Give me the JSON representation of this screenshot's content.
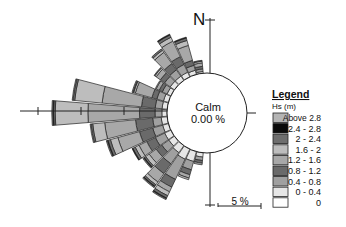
{
  "chart_data": {
    "type": "wave-rose",
    "title": "",
    "north_label": "N",
    "calm": {
      "label": "Calm",
      "value": "0.00 %"
    },
    "scale_bar": {
      "label": "5 %",
      "percent": 5
    },
    "legend": {
      "title": "Legend",
      "subtitle": "Hs (m)",
      "bins": [
        {
          "label": "Above 2.8",
          "color": "#b4b4b4"
        },
        {
          "label": "2.4 - 2.8",
          "color": "#0a0a0a"
        },
        {
          "label": "2 - 2.4",
          "color": "#6e6e6e"
        },
        {
          "label": "1.6 - 2",
          "color": "#bdbdbd"
        },
        {
          "label": "1.2 - 1.6",
          "color": "#a8a8a8"
        },
        {
          "label": "0.8 - 1.2",
          "color": "#6a6a6a"
        },
        {
          "label": "0.4 - 0.8",
          "color": "#a0a0a0"
        },
        {
          "label": "0 - 0.4",
          "color": "#e6e6e6"
        },
        {
          "label": "0",
          "color": "#ffffff"
        }
      ]
    },
    "stack_order_inner_to_outer": [
      "0",
      "0 - 0.4",
      "0.4 - 0.8",
      "0.8 - 1.2",
      "1.2 - 1.6",
      "1.6 - 2",
      "2 - 2.4",
      "2.4 - 2.8",
      "Above 2.8"
    ],
    "sectors": [
      {
        "dir": 190,
        "values": [
          0,
          0.5,
          0.4,
          0.3,
          0.2,
          0,
          0,
          0,
          0
        ]
      },
      {
        "dir": 200,
        "values": [
          0,
          1.2,
          1.0,
          0.6,
          0.4,
          0.2,
          0,
          0,
          0
        ]
      },
      {
        "dir": 210,
        "values": [
          0,
          1.3,
          2.6,
          1.0,
          0.6,
          0.5,
          0.3,
          0.1,
          0.1
        ]
      },
      {
        "dir": 220,
        "values": [
          0,
          1.0,
          1.6,
          1.4,
          1.2,
          0.4,
          0.2,
          0.1,
          0.1
        ]
      },
      {
        "dir": 230,
        "values": [
          0,
          0.8,
          1.0,
          0.8,
          1.0,
          0.5,
          0.2,
          0.1,
          0.1
        ]
      },
      {
        "dir": 240,
        "values": [
          0,
          0.8,
          1.2,
          1.1,
          1.0,
          0.5,
          0.3,
          0.1,
          0.0
        ]
      },
      {
        "dir": 250,
        "values": [
          0,
          0.7,
          1.2,
          1.6,
          2.6,
          0.9,
          0.3,
          0.1,
          0.1
        ]
      },
      {
        "dir": 260,
        "values": [
          0,
          0.7,
          1.0,
          2.0,
          3.6,
          1.4,
          0.2,
          0.0,
          0.1
        ]
      },
      {
        "dir": 270,
        "values": [
          0,
          0.6,
          0.8,
          1.8,
          6.0,
          3.8,
          0.2,
          0.1,
          0.1
        ]
      },
      {
        "dir": 280,
        "values": [
          0,
          0.6,
          0.8,
          1.6,
          4.6,
          3.2,
          0.2,
          0.0,
          0.1
        ]
      },
      {
        "dir": 290,
        "values": [
          0,
          0.6,
          0.8,
          0.6,
          2.0,
          0.2,
          0.1,
          0,
          0.1
        ]
      },
      {
        "dir": 300,
        "values": [
          0,
          0.5,
          0.6,
          0.4,
          0.4,
          0.1,
          0,
          0,
          0
        ]
      },
      {
        "dir": 310,
        "values": [
          0,
          0.6,
          0.8,
          0.6,
          0.6,
          0.2,
          0.1,
          0,
          0
        ]
      },
      {
        "dir": 320,
        "values": [
          0,
          0.6,
          0.9,
          0.9,
          1.6,
          0.3,
          0.2,
          0,
          0
        ]
      },
      {
        "dir": 330,
        "values": [
          0,
          0.6,
          1.0,
          1.0,
          2.0,
          0.5,
          0.3,
          0.1,
          0
        ]
      },
      {
        "dir": 340,
        "values": [
          0,
          0.5,
          0.6,
          0.6,
          1.8,
          0.6,
          0.3,
          0.1,
          0
        ]
      },
      {
        "dir": 350,
        "values": [
          0,
          0.2,
          0.3,
          0.3,
          0.4,
          0.2,
          0.1,
          0,
          0
        ]
      }
    ],
    "units": "% occurrence",
    "ylabel": "Hs (m)"
  }
}
